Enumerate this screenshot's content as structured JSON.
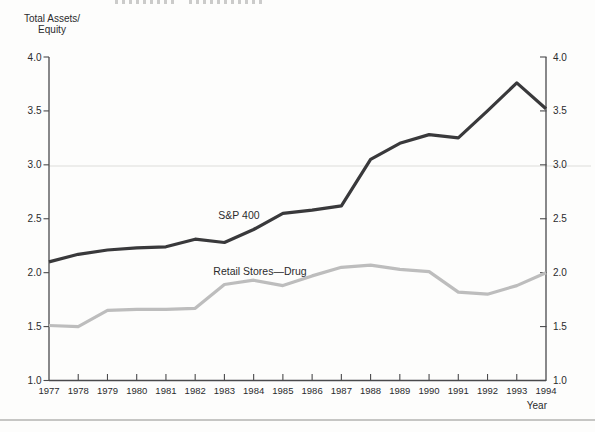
{
  "figure": {
    "y_axis_title_line1": "Total Assets/",
    "y_axis_title_line2": "Equity",
    "x_axis_title": "Year"
  },
  "chart_data": {
    "type": "line",
    "title": "",
    "xlabel": "Year",
    "ylabel": "Total Assets/ Equity",
    "ylim": [
      1.0,
      4.0
    ],
    "yticks": [
      4.0,
      3.5,
      3.0,
      2.5,
      2.0,
      1.5,
      1.0
    ],
    "ytick_labels": [
      "4.0",
      "3.5",
      "3.0",
      "2.5",
      "2.0",
      "1.5",
      "1.0"
    ],
    "dual_y_axis": true,
    "grid": false,
    "legend_position": "inline-labels",
    "x": [
      1977,
      1978,
      1979,
      1980,
      1981,
      1982,
      1983,
      1984,
      1985,
      1986,
      1987,
      1988,
      1989,
      1990,
      1991,
      1992,
      1993,
      1994
    ],
    "series": [
      {
        "name": "S&P 400",
        "color": "#39393b",
        "values": [
          2.1,
          2.17,
          2.21,
          2.23,
          2.24,
          2.31,
          2.28,
          2.4,
          2.55,
          2.58,
          2.62,
          3.05,
          3.2,
          3.28,
          3.25,
          3.5,
          3.76,
          3.52
        ]
      },
      {
        "name": "Retail Stores—Drug",
        "color": "#bdbdbd",
        "values": [
          1.51,
          1.5,
          1.65,
          1.66,
          1.66,
          1.67,
          1.89,
          1.93,
          1.88,
          1.97,
          2.05,
          2.07,
          2.03,
          2.01,
          1.82,
          1.8,
          1.88,
          2.0
        ]
      }
    ]
  }
}
